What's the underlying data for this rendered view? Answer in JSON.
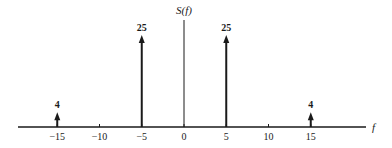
{
  "chart_data": {
    "type": "stem",
    "title": "",
    "ylabel": "S(f)",
    "xlabel": "f",
    "x_ticks": [
      -15,
      -10,
      -5,
      0,
      5,
      10,
      15
    ],
    "x_tick_labels": [
      "−15",
      "−10",
      "−5",
      "0",
      "5",
      "10",
      "15"
    ],
    "xlim": [
      -20,
      22
    ],
    "ylim": [
      0,
      28
    ],
    "grid": false,
    "legend": null,
    "series": [
      {
        "name": "S(f) impulses",
        "x": [
          -15,
          -5,
          5,
          15
        ],
        "values": [
          4,
          25,
          25,
          4
        ],
        "labels": [
          "4",
          "25",
          "25",
          "4"
        ],
        "marker": "arrow"
      }
    ],
    "colors": {
      "ink": "#1a1a1a",
      "background": "#ffffff"
    }
  }
}
